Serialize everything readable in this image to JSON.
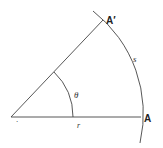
{
  "diagram": {
    "labels": {
      "point_a": "A",
      "point_a_prime": "A′",
      "angle": "θ",
      "arc_length": "s",
      "radius": "r",
      "vertex_mark": "."
    },
    "colors": {
      "line": "#333333",
      "text": "#222222",
      "background": "#ffffff"
    }
  }
}
